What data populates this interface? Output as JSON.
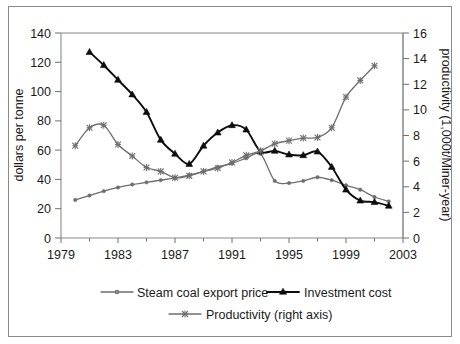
{
  "figure": {
    "border_color": "#8b8b8b",
    "background": "#ffffff"
  },
  "axes": {
    "left": {
      "title": "dollars per tonne",
      "ticks": [
        "0",
        "20",
        "40",
        "60",
        "80",
        "100",
        "120",
        "140"
      ],
      "min": 0,
      "max": 140
    },
    "right": {
      "title": "productivity (1,000t/Miner-year)",
      "ticks": [
        "0",
        "2",
        "4",
        "6",
        "8",
        "10",
        "12",
        "14",
        "16"
      ],
      "min": 0,
      "max": 16
    },
    "bottom": {
      "title": "",
      "ticks": [
        "1979",
        "1983",
        "1987",
        "1991",
        "1995",
        "1999",
        "2003"
      ],
      "min": 1979,
      "max": 2003
    }
  },
  "legend": {
    "items": [
      {
        "label": "Steam coal export price",
        "color": "#6e6e6e",
        "marker": "dot"
      },
      {
        "label": "Investment cost",
        "color": "#0d0d0d",
        "marker": "triangle"
      },
      {
        "label": "Productivity (right axis)",
        "color": "#6e6e6e",
        "marker": "star"
      }
    ]
  },
  "chart_data": {
    "type": "line",
    "title": "",
    "subtitle": "",
    "xlabel": "",
    "ylabel": "dollars per tonne",
    "y2label": "productivity (1,000t/Miner-year)",
    "xlim": [
      1979,
      2003
    ],
    "ylim": [
      0,
      140
    ],
    "y2lim": [
      0,
      16
    ],
    "grid": false,
    "legend_position": "bottom",
    "x_ticks": [
      1979,
      1983,
      1987,
      1991,
      1995,
      1999,
      2003
    ],
    "y_ticks": [
      0,
      20,
      40,
      60,
      80,
      100,
      120,
      140
    ],
    "y2_ticks": [
      0,
      2,
      4,
      6,
      8,
      10,
      12,
      14,
      16
    ],
    "series": [
      {
        "name": "Steam coal export price",
        "axis": "left",
        "units": "dollars per tonne",
        "color": "#6e6e6e",
        "marker": "dot",
        "x": [
          1980,
          1981,
          1982,
          1983,
          1984,
          1985,
          1986,
          1987,
          1988,
          1989,
          1990,
          1991,
          1992,
          1993,
          1994,
          1995,
          1996,
          1997,
          1998,
          1999,
          2000,
          2001,
          2002
        ],
        "values": [
          26,
          29,
          32,
          34.5,
          36.5,
          38,
          39.5,
          41,
          43,
          45.5,
          48.5,
          51,
          54.5,
          57.5,
          39,
          37.5,
          39,
          41.5,
          39.5,
          36,
          33,
          28,
          25
        ]
      },
      {
        "name": "Investment cost",
        "axis": "left",
        "units": "dollars per tonne",
        "color": "#0d0d0d",
        "marker": "triangle",
        "x": [
          1981,
          1982,
          1983,
          1984,
          1985,
          1986,
          1987,
          1988,
          1989,
          1990,
          1991,
          1992,
          1993,
          1994,
          1995,
          1996,
          1997,
          1998,
          1999,
          2000,
          2001,
          2002
        ],
        "values": [
          127,
          118,
          108,
          98,
          86,
          67,
          57.5,
          50.5,
          63,
          72,
          77,
          74,
          59,
          59.5,
          57,
          56.5,
          59,
          48.5,
          33,
          25.5,
          24.5,
          22
        ]
      },
      {
        "name": "Productivity (right axis)",
        "axis": "right",
        "units": "1,000t/Miner-year",
        "color": "#6e6e6e",
        "marker": "star",
        "x": [
          1980,
          1981,
          1982,
          1983,
          1984,
          1985,
          1986,
          1987,
          1988,
          1989,
          1990,
          1991,
          1992,
          1993,
          1994,
          1995,
          1996,
          1997,
          1998,
          1999,
          2000,
          2001
        ],
        "values": [
          7.2,
          8.6,
          8.8,
          7.3,
          6.4,
          5.5,
          5.2,
          4.7,
          4.85,
          5.2,
          5.45,
          5.9,
          6.45,
          6.8,
          7.35,
          7.6,
          7.8,
          7.85,
          8.6,
          11.0,
          12.3,
          13.45
        ]
      }
    ]
  }
}
